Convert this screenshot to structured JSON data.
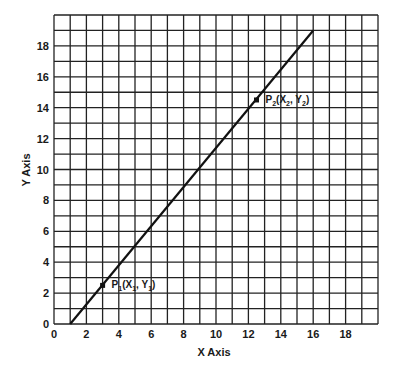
{
  "chart_data": {
    "type": "line",
    "title": "",
    "xlabel": "X Axis",
    "ylabel": "Y Axis",
    "xlim": [
      0,
      20
    ],
    "ylim": [
      0,
      20
    ],
    "grid": true,
    "grid_step": 1,
    "x_ticks": [
      "0",
      "2",
      "4",
      "6",
      "8",
      "10",
      "12",
      "14",
      "16",
      "18"
    ],
    "y_ticks": [
      "0",
      "2",
      "4",
      "6",
      "8",
      "10",
      "12",
      "14",
      "16",
      "18"
    ],
    "series": [
      {
        "name": "line",
        "x": [
          1,
          16
        ],
        "y": [
          0,
          19
        ]
      }
    ],
    "points": [
      {
        "name": "P1",
        "x": 3,
        "y": 2.5,
        "label": "P",
        "sub": "1",
        "coords": [
          "X",
          "1",
          "Y",
          "1"
        ]
      },
      {
        "name": "P2",
        "x": 12.5,
        "y": 14.5,
        "label": "P",
        "sub": "2",
        "coords": [
          "X",
          "2",
          "Y",
          "2"
        ]
      }
    ],
    "legend": "none"
  },
  "labels": {
    "x_axis": "X Axis",
    "y_axis": "Y Axis",
    "p1": {
      "p": "P",
      "psub": "1",
      "open": "(X",
      "xsub": "1",
      "mid": ", Y",
      "ysub": "1",
      "close": ")"
    },
    "p2": {
      "p": "P",
      "psub": "2",
      "open": "(X",
      "xsub": "2",
      "mid": ", Y",
      "ysub": "2",
      "close": ")"
    }
  }
}
